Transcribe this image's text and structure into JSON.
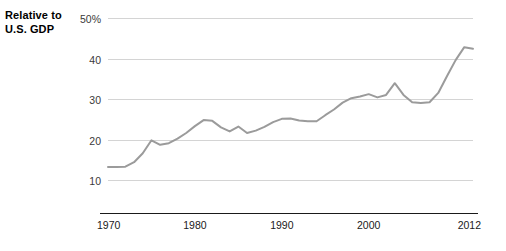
{
  "chart_data": {
    "type": "line",
    "title": "Relative to\nU.S. GDP",
    "title_line1": "Relative to",
    "title_line2": "U.S. GDP",
    "xlabel": "",
    "ylabel": "",
    "xlim": [
      1970,
      2012
    ],
    "ylim": [
      8,
      50
    ],
    "grid": true,
    "legend": false,
    "y_ticks": [
      {
        "value": 50,
        "label": "50%"
      },
      {
        "value": 40,
        "label": "40"
      },
      {
        "value": 30,
        "label": "30"
      },
      {
        "value": 20,
        "label": "20"
      },
      {
        "value": 10,
        "label": "10"
      }
    ],
    "x_ticks": [
      {
        "value": 1970,
        "label": "1970"
      },
      {
        "value": 1980,
        "label": "1980"
      },
      {
        "value": 1990,
        "label": "1990"
      },
      {
        "value": 2000,
        "label": "2000"
      },
      {
        "value": 2012,
        "label": "2012"
      }
    ],
    "line_color": "#9b9b9b",
    "gridline_color": "#d4d4d4",
    "axis_color": "#1a1a1a",
    "background_color": "#ffffff",
    "series": [
      {
        "name": "Relative to U.S. GDP",
        "color": "#9b9b9b",
        "x": [
          1970,
          1971,
          1972,
          1973,
          1974,
          1975,
          1976,
          1977,
          1978,
          1979,
          1980,
          1981,
          1982,
          1983,
          1984,
          1985,
          1986,
          1987,
          1988,
          1989,
          1990,
          1991,
          1992,
          1993,
          1994,
          1995,
          1996,
          1997,
          1998,
          1999,
          2000,
          2001,
          2002,
          2003,
          2004,
          2005,
          2006,
          2007,
          2008,
          2009,
          2010,
          2011,
          2012
        ],
        "values": [
          13.2,
          13.2,
          13.3,
          14.4,
          16.6,
          19.8,
          18.7,
          19.1,
          20.2,
          21.6,
          23.3,
          24.8,
          24.6,
          23.0,
          22.0,
          23.2,
          21.6,
          22.2,
          23.1,
          24.3,
          25.1,
          25.2,
          24.7,
          24.5,
          24.5,
          26.0,
          27.4,
          29.1,
          30.2,
          30.6,
          31.2,
          30.4,
          31.0,
          33.9,
          31.0,
          29.2,
          29.0,
          29.2,
          31.5,
          35.6,
          39.6,
          42.8,
          42.4
        ]
      }
    ],
    "annotations": []
  }
}
